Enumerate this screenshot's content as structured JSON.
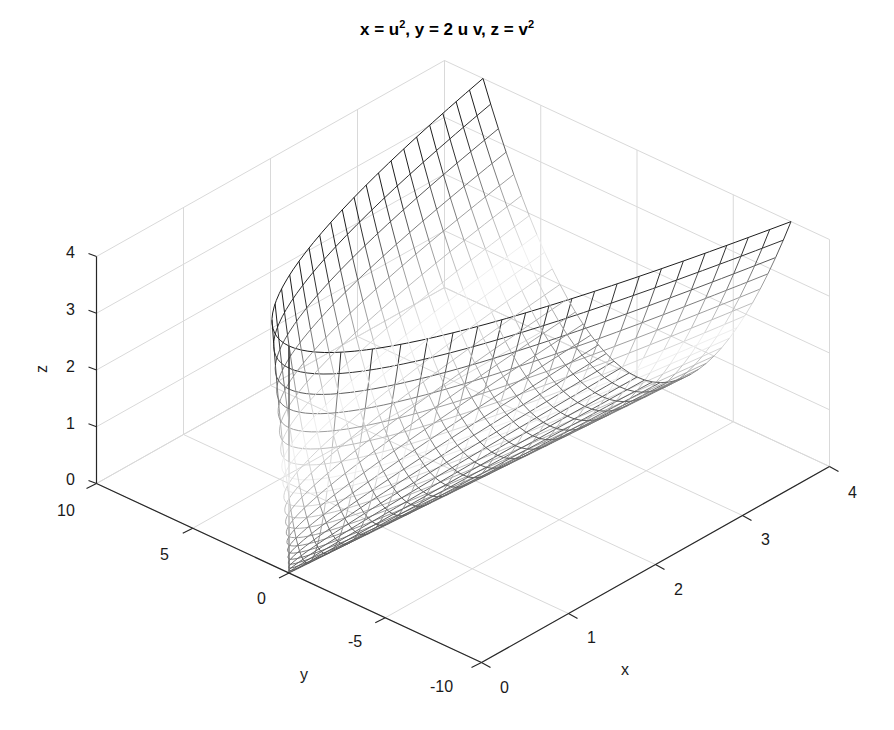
{
  "chart_data": {
    "type": "surface3d",
    "title_parts": {
      "x": "x = u",
      "x_sup": "2",
      "mid": ", y = 2 u v, z = v",
      "z_sup": "2"
    },
    "xlabel": "x",
    "ylabel": "y",
    "zlabel": "z",
    "xlim": [
      0,
      4
    ],
    "ylim": [
      -10,
      10
    ],
    "zlim": [
      0,
      4
    ],
    "xticks": [
      0,
      1,
      2,
      3,
      4
    ],
    "yticks": [
      -10,
      -5,
      0,
      5,
      10
    ],
    "zticks": [
      0,
      1,
      2,
      3,
      4
    ],
    "xtick_labels": [
      "0",
      "1",
      "2",
      "3",
      "4"
    ],
    "ytick_labels": [
      "-10",
      "-5",
      "0",
      "5",
      "10"
    ],
    "ztick_labels": [
      "0",
      "1",
      "2",
      "3",
      "4"
    ],
    "grid": true,
    "parametric": {
      "x": "u^2",
      "y": "2*u*v",
      "z": "v^2"
    },
    "u_range": [
      0,
      2
    ],
    "v_range": [
      -2,
      2
    ],
    "u_steps": 10,
    "v_steps": 40,
    "colormap": "gray (edge color by z: dark at low/high z, white mid)",
    "face_color": "#ffffff",
    "view": "default 3D (az ≈ -37.5°, el ≈ 30°)"
  },
  "colors": {
    "axis": "#262626",
    "grid": "#d9d9d9",
    "background": "#ffffff",
    "mesh_dark": "#222222",
    "mesh_light": "#f4f4f4"
  },
  "labels": {
    "z_ticks": [
      {
        "text": "4"
      },
      {
        "text": "3"
      },
      {
        "text": "2"
      },
      {
        "text": "1"
      },
      {
        "text": "0"
      }
    ]
  }
}
